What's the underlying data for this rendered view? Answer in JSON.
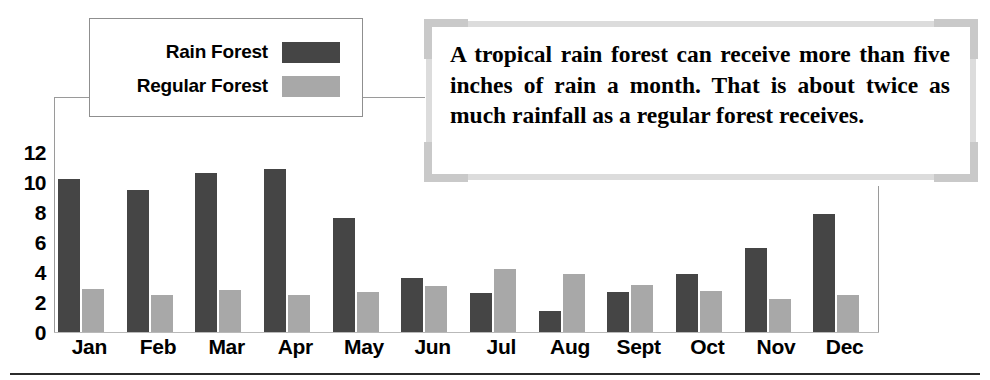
{
  "chart_data": {
    "type": "bar",
    "title": "",
    "xlabel": "",
    "ylabel": "",
    "ylim": [
      0,
      12
    ],
    "yticks": [
      12,
      10,
      8,
      6,
      4,
      2,
      0
    ],
    "grid": false,
    "legend_position": "top-left",
    "categories": [
      "Jan",
      "Feb",
      "Mar",
      "Apr",
      "May",
      "Jun",
      "Jul",
      "Aug",
      "Sept",
      "Oct",
      "Nov",
      "Dec"
    ],
    "series": [
      {
        "name": "Rain Forest",
        "color": "#454545",
        "values": [
          10.2,
          9.5,
          10.6,
          10.9,
          7.6,
          3.6,
          2.6,
          1.4,
          2.65,
          3.85,
          5.6,
          7.9
        ]
      },
      {
        "name": "Regular Forest",
        "color": "#a8a8a8",
        "values": [
          2.9,
          2.5,
          2.8,
          2.5,
          2.7,
          3.05,
          4.2,
          3.85,
          3.15,
          2.75,
          2.2,
          2.5
        ]
      }
    ]
  },
  "legend": {
    "items": [
      {
        "label": "Rain Forest",
        "color": "#454545"
      },
      {
        "label": "Regular Forest",
        "color": "#a8a8a8"
      }
    ]
  },
  "callout": {
    "text": "A tropical rain forest can receive more than five inches of rain a month. That is about twice as much rainfall as a regular forest receives."
  }
}
